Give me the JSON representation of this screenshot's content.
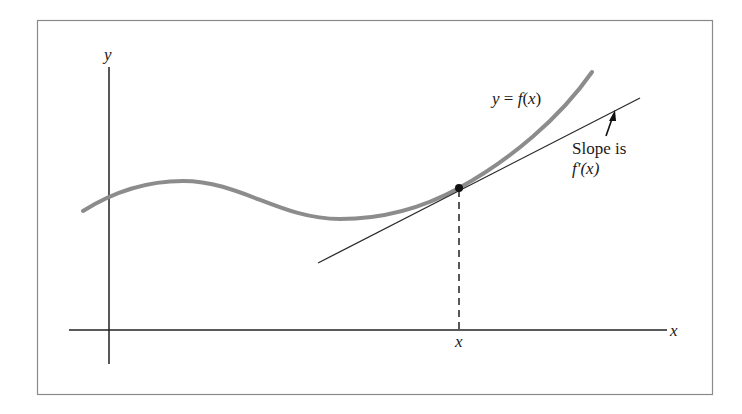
{
  "diagram": {
    "axes": {
      "x_label": "x",
      "y_label": "y"
    },
    "curve": {
      "label": "y = f(x)",
      "color": "#8c8c8c"
    },
    "tangent": {
      "label_line1": "Slope is",
      "label_line2": "f′(x)",
      "color": "#2a2a2a"
    },
    "point": {
      "x_tick_label": "x",
      "color": "#111111"
    },
    "frame_color": "#8a8a8a"
  }
}
